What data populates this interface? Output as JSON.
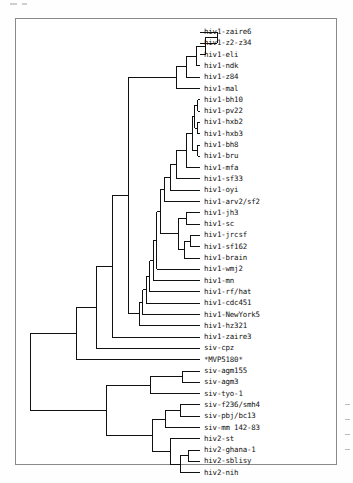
{
  "document": {
    "title": "Phylogenetic tree of HIV and SIV isolates",
    "border_color": "#8a8a8a",
    "background_color": "#ffffff",
    "line_color": "#111111"
  },
  "chart_data": {
    "type": "tree",
    "title": "",
    "xlabel": "",
    "ylabel": "",
    "orientation": "left-to-right rectangular cladogram",
    "root_x": 30,
    "tip_x_default": 200,
    "first_tip_y": 32,
    "tip_spacing": 11.75,
    "n_taxa": 36,
    "taxa": [
      "hiv1-zaire6",
      "hiv1-z2-z34",
      "hiv1-eli",
      "hiv1-ndk",
      "hiv1-z84",
      "hiv1-mal",
      "hiv1-bh10",
      "hiv1-pv22",
      "hiv1-hxb2",
      "hiv1-hxb3",
      "hiv1-bh8",
      "hiv1-bru",
      "hiv1-mfa",
      "hiv1-sf33",
      "hiv1-oyi",
      "hiv1-arv2/sf2",
      "hiv1-jh3",
      "hiv1-sc",
      "hiv1-jrcsf",
      "hiv1-sf162",
      "hiv1-brain",
      "hiv1-wmj2",
      "hiv1-mn",
      "hiv1-rf/hat",
      "hiv1-cdc451",
      "hiv1-NewYork5",
      "hiv1-hz321",
      "hiv1-zaire3",
      "siv-cpz",
      "*MVP5180*",
      "siv-agm155",
      "siv-agm3",
      "siv-tyo-1",
      "siv-f236/smh4",
      "siv-pbj/bc13",
      "siv-mm 142-83",
      "hiv2-st",
      "hiv2-ghana-1",
      "hiv2-sblisy",
      "hiv2-nih"
    ],
    "tips": [
      {
        "label": "hiv1-zaire6",
        "y": 32.0,
        "branch_x": 217
      },
      {
        "label": "hiv1-z2-z34",
        "y": 43.3,
        "branch_x": 217
      },
      {
        "label": "hiv1-eli",
        "y": 54.6,
        "branch_x": 205
      },
      {
        "label": "hiv1-ndk",
        "y": 65.9,
        "branch_x": 172
      },
      {
        "label": "hiv1-z84",
        "y": 77.2,
        "branch_x": 165
      },
      {
        "label": "hiv1-mal",
        "y": 88.5,
        "branch_x": 158
      },
      {
        "label": "hiv1-bh10",
        "y": 99.8,
        "branch_x": 196
      },
      {
        "label": "hiv1-pv22",
        "y": 111.1,
        "branch_x": 196
      },
      {
        "label": "hiv1-hxb2",
        "y": 122.4,
        "branch_x": 193
      },
      {
        "label": "hiv1-hxb3",
        "y": 133.7,
        "branch_x": 193
      },
      {
        "label": "hiv1-bh8",
        "y": 145.0,
        "branch_x": 189
      },
      {
        "label": "hiv1-bru",
        "y": 156.3,
        "branch_x": 189
      },
      {
        "label": "hiv1-mfa",
        "y": 167.6,
        "branch_x": 181
      },
      {
        "label": "hiv1-sf33",
        "y": 178.9,
        "branch_x": 166
      },
      {
        "label": "hiv1-oyi",
        "y": 190.2,
        "branch_x": 163
      },
      {
        "label": "hiv1-arv2/sf2",
        "y": 201.5,
        "branch_x": 160
      },
      {
        "label": "hiv1-jh3",
        "y": 212.8,
        "branch_x": 184
      },
      {
        "label": "hiv1-sc",
        "y": 224.1,
        "branch_x": 184
      },
      {
        "label": "hiv1-jrcsf",
        "y": 235.4,
        "branch_x": 186
      },
      {
        "label": "hiv1-sf162",
        "y": 246.7,
        "branch_x": 186
      },
      {
        "label": "hiv1-brain",
        "y": 258.0,
        "branch_x": 178
      },
      {
        "label": "hiv1-wmj2",
        "y": 269.3,
        "branch_x": 157
      },
      {
        "label": "hiv1-mn",
        "y": 280.6,
        "branch_x": 154
      },
      {
        "label": "hiv1-rf/hat",
        "y": 291.9,
        "branch_x": 151
      },
      {
        "label": "hiv1-cdc451",
        "y": 303.2,
        "branch_x": 148
      },
      {
        "label": "hiv1-NewYork5",
        "y": 314.5,
        "branch_x": 145
      },
      {
        "label": "hiv1-hz321",
        "y": 325.8,
        "branch_x": 142
      },
      {
        "label": "hiv1-zaire3",
        "y": 337.1,
        "branch_x": 128
      },
      {
        "label": "siv-cpz",
        "y": 348.4,
        "branch_x": 95
      },
      {
        "label": "*MVP5180*",
        "y": 359.7,
        "branch_x": 75
      },
      {
        "label": "siv-agm155",
        "y": 371.0,
        "branch_x": 180
      },
      {
        "label": "siv-agm3",
        "y": 382.3,
        "branch_x": 180
      },
      {
        "label": "siv-tyo-1",
        "y": 393.6,
        "branch_x": 155
      },
      {
        "label": "siv-f236/smh4",
        "y": 404.9,
        "branch_x": 178
      },
      {
        "label": "siv-pbj/bc13",
        "y": 416.2,
        "branch_x": 178
      },
      {
        "label": "siv-mm 142-83",
        "y": 427.5,
        "branch_x": 160
      },
      {
        "label": "hiv2-st",
        "y": 438.8,
        "branch_x": 168
      },
      {
        "label": "hiv2-ghana-1",
        "y": 450.1,
        "branch_x": 173
      },
      {
        "label": "hiv2-sblisy",
        "y": 461.4,
        "branch_x": 173
      },
      {
        "label": "hiv2-nih",
        "y": 472.7,
        "branch_x": 166
      }
    ]
  }
}
